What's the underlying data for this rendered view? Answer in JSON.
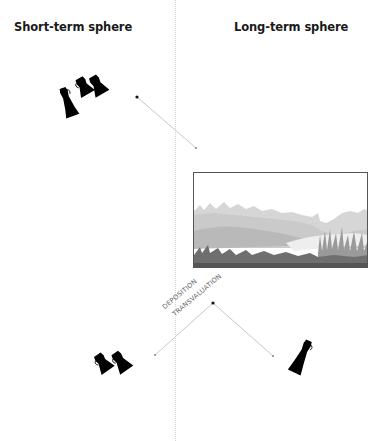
{
  "diagram": {
    "headings": {
      "left": "Short-term sphere",
      "right": "Long-term sphere"
    },
    "process_labels": {
      "upper": "DEPOSITION",
      "lower": "TRANSVALUATION"
    },
    "nodes": [
      {
        "id": "short-term-vessels-top",
        "description": "group of three black vessels",
        "sphere": "short-term"
      },
      {
        "id": "landscape-deposit",
        "description": "grassland / wetland landscape box",
        "sphere": "long-term"
      },
      {
        "id": "short-term-vessels-bottom",
        "description": "pair of black vessels",
        "sphere": "short-term"
      },
      {
        "id": "long-term-vessel",
        "description": "single black vessel",
        "sphere": "long-term"
      }
    ],
    "connectors": [
      {
        "from": "short-term-vessels-top",
        "to": "landscape-deposit"
      },
      {
        "from": "split-point",
        "to": "short-term-vessels-bottom"
      },
      {
        "from": "split-point",
        "to": "long-term-vessel"
      }
    ],
    "colors": {
      "heading": "#1a1a1a",
      "connector": "#c8c8c8",
      "vessel": "#000000",
      "divider": "#d4d4d4",
      "frame": "#555555"
    }
  }
}
